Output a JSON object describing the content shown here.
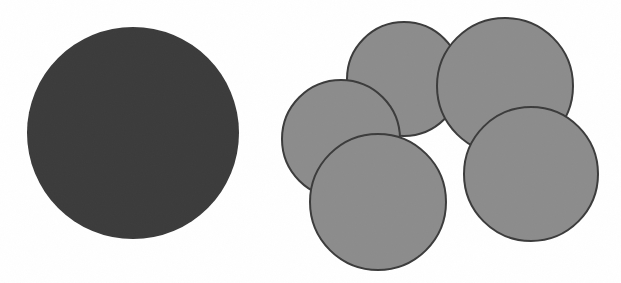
{
  "figure": {
    "caption": "",
    "width": 621,
    "height": 283,
    "background_color": "#ffffff"
  },
  "colors": {
    "large_circle_fill": "#3a3a3a",
    "large_circle_stroke": "#2e2e2e",
    "small_circle_fill": "#8c8c8c",
    "small_circle_stroke": "#3b3b3b",
    "background": "#ffffff"
  },
  "chart_data": {
    "type": "scatter",
    "title": "",
    "subtitle": "",
    "xlabel": "",
    "ylabel": "",
    "xlim": [
      0,
      621
    ],
    "ylim": [
      0,
      283
    ],
    "grid": false,
    "legend_position": "none",
    "annotations": [],
    "series": [
      {
        "name": "single-large-disc",
        "group_label": "left-group",
        "marker": "circle",
        "fill": "#3a3a3a",
        "stroke": "#2e2e2e",
        "stroke_width": 0,
        "count": 1,
        "values": [
          {
            "id": "large-disc",
            "cx": 133,
            "cy": 133,
            "r": 106,
            "diameter": 212
          }
        ]
      },
      {
        "name": "five-small-discs",
        "group_label": "right-group",
        "marker": "circle",
        "fill": "#8c8c8c",
        "stroke": "#3b3b3b",
        "stroke_width": 2,
        "count": 5,
        "values": [
          {
            "id": "disc-a-top-left",
            "cx": 404,
            "cy": 79,
            "r": 57,
            "diameter": 114,
            "z": 1
          },
          {
            "id": "disc-c-mid-left",
            "cx": 341,
            "cy": 139,
            "r": 59,
            "diameter": 118,
            "z": 2
          },
          {
            "id": "disc-b-top-right",
            "cx": 505,
            "cy": 86,
            "r": 68,
            "diameter": 136,
            "z": 3
          },
          {
            "id": "disc-e-bottom-right",
            "cx": 531,
            "cy": 174,
            "r": 67,
            "diameter": 134,
            "z": 4
          },
          {
            "id": "disc-d-bottom-left",
            "cx": 378,
            "cy": 202,
            "r": 68,
            "diameter": 136,
            "z": 5
          }
        ]
      }
    ]
  }
}
